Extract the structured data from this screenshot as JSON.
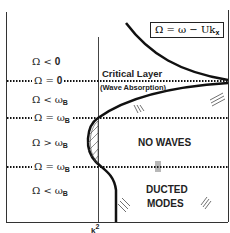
{
  "diagram": {
    "formula_box": {
      "lhs": "Ω = ω − Uk",
      "sub": "x"
    },
    "regions": [
      {
        "label": "Ω < 0",
        "sym": "Ω <",
        "val": "0"
      },
      {
        "label": "Ω = 0",
        "sym": "Ω =",
        "val": "0"
      },
      {
        "label": "Ω < ω_B",
        "sym": "Ω <",
        "val": "ω",
        "sub": "B"
      },
      {
        "label": "Ω = ω_B",
        "sym": "Ω =",
        "val": "ω",
        "sub": "B"
      },
      {
        "label": "Ω > ω_B",
        "sym": "Ω >",
        "val": "ω",
        "sub": "B"
      },
      {
        "label": "Ω = ω_B",
        "sym": "Ω =",
        "val": "ω",
        "sub": "B"
      },
      {
        "label": "Ω < ω_B",
        "sym": "Ω <",
        "val": "ω",
        "sub": "B"
      }
    ],
    "annotations": {
      "critical_layer": "Critical Layer",
      "wave_absorption": "(Wave Absorption)",
      "no_waves": "NO WAVES",
      "ducted": "DUCTED",
      "modes": "MODES"
    },
    "x_axis_label": {
      "base": "k",
      "sup": "2"
    },
    "colors": {
      "line": "#111111",
      "background": "#ffffff"
    }
  }
}
